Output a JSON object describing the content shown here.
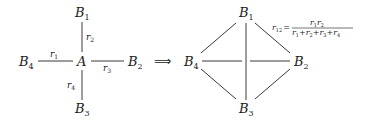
{
  "diagram": {
    "left": {
      "center": {
        "label": "A"
      },
      "nodes": [
        {
          "id": "B1",
          "base": "B",
          "sub": "1"
        },
        {
          "id": "B2",
          "base": "B",
          "sub": "2"
        },
        {
          "id": "B3",
          "base": "B",
          "sub": "3"
        },
        {
          "id": "B4",
          "base": "B",
          "sub": "4"
        }
      ],
      "edges": [
        {
          "from": "B4",
          "to": "A",
          "base": "r",
          "sub": "1"
        },
        {
          "from": "B1",
          "to": "A",
          "base": "r",
          "sub": "2"
        },
        {
          "from": "A",
          "to": "B2",
          "base": "r",
          "sub": "3"
        },
        {
          "from": "A",
          "to": "B3",
          "base": "r",
          "sub": "4"
        }
      ]
    },
    "arrow": "⟹",
    "right": {
      "nodes": [
        {
          "id": "B1",
          "base": "B",
          "sub": "1"
        },
        {
          "id": "B2",
          "base": "B",
          "sub": "2"
        },
        {
          "id": "B3",
          "base": "B",
          "sub": "3"
        },
        {
          "id": "B4",
          "base": "B",
          "sub": "4"
        }
      ],
      "edges": [
        [
          "B1",
          "B2"
        ],
        [
          "B1",
          "B3"
        ],
        [
          "B1",
          "B4"
        ],
        [
          "B2",
          "B3"
        ],
        [
          "B2",
          "B4"
        ],
        [
          "B3",
          "B4"
        ]
      ],
      "formula": {
        "lhs_base": "r",
        "lhs_sub": "12",
        "equals": "=",
        "numerator": [
          {
            "base": "r",
            "sub": "1"
          },
          {
            "base": "r",
            "sub": "2"
          }
        ],
        "denominator": [
          {
            "base": "r",
            "sub": "1"
          },
          {
            "op": "+"
          },
          {
            "base": "r",
            "sub": "2"
          },
          {
            "op": "+"
          },
          {
            "base": "r",
            "sub": "3"
          },
          {
            "op": "+"
          },
          {
            "base": "r",
            "sub": "4"
          }
        ]
      }
    }
  }
}
